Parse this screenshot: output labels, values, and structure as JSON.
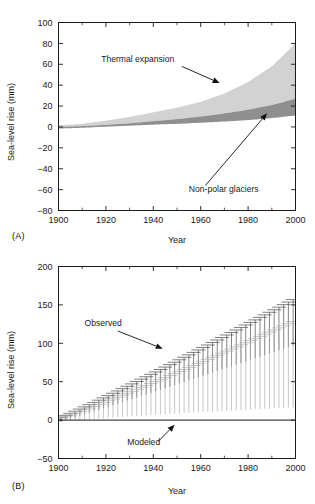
{
  "figure": {
    "panels": [
      {
        "id": "A",
        "label": "(A)",
        "xlabel": "Year",
        "ylabel": "Sea-level rise (mm)"
      },
      {
        "id": "B",
        "label": "(B)",
        "xlabel": "Year",
        "ylabel": "Sea-level rise (mm)"
      }
    ]
  },
  "chart_data": [
    {
      "type": "area",
      "id": "panel-a",
      "title": "",
      "xlabel": "Year",
      "ylabel": "Sea-level rise (mm)",
      "xlim": [
        1900,
        2000
      ],
      "ylim": [
        -80,
        100
      ],
      "xticks": [
        1900,
        1920,
        1940,
        1960,
        1980,
        2000
      ],
      "xtick_labels": [
        "1900",
        "1920",
        "1940",
        "1960",
        "1980",
        "2000"
      ],
      "xticks_minor": [
        1910,
        1930,
        1950,
        1970,
        1990
      ],
      "yticks": [
        -80,
        -60,
        -40,
        -20,
        0,
        20,
        40,
        60,
        80,
        100
      ],
      "ytick_labels": [
        "−80",
        "−60",
        "−40",
        "−20",
        "0",
        "20",
        "40",
        "60",
        "80",
        "100"
      ],
      "grid": false,
      "legend": "none",
      "annotations": [
        {
          "text": "Thermal expansion",
          "text_x": 1918,
          "text_y": 62,
          "arrow_from_x": 1952,
          "arrow_from_y": 58,
          "arrow_to_x": 1968,
          "arrow_to_y": 42
        },
        {
          "text": "Non-polar glaciers",
          "text_x": 1955,
          "text_y": -62,
          "arrow_from_x": 1962,
          "arrow_from_y": -56,
          "arrow_to_x": 1988,
          "arrow_to_y": 13
        }
      ],
      "series": [
        {
          "name": "Thermal expansion",
          "kind": "band",
          "color": "#d2d2d2",
          "x": [
            1900,
            1910,
            1920,
            1930,
            1940,
            1950,
            1960,
            1970,
            1980,
            1990,
            2000
          ],
          "upper": [
            1.5,
            3.0,
            6.0,
            9.5,
            14.0,
            18.5,
            24.0,
            32.0,
            43.0,
            58.0,
            80.0
          ],
          "lower": [
            0.0,
            0.8,
            2.0,
            3.5,
            5.5,
            7.5,
            10.0,
            13.0,
            16.5,
            21.0,
            27.0
          ]
        },
        {
          "name": "Non-polar glaciers",
          "kind": "band",
          "color": "#8f8f8f",
          "x": [
            1900,
            1910,
            1920,
            1930,
            1940,
            1950,
            1960,
            1970,
            1980,
            1990,
            2000
          ],
          "upper": [
            0.0,
            0.8,
            2.0,
            3.5,
            5.5,
            7.5,
            10.0,
            13.0,
            16.5,
            21.0,
            27.0
          ],
          "lower": [
            -1.5,
            -0.8,
            0.3,
            1.2,
            2.2,
            3.0,
            4.0,
            5.2,
            6.6,
            8.5,
            11.0
          ]
        }
      ]
    },
    {
      "type": "line",
      "id": "panel-b",
      "title": "",
      "xlabel": "Year",
      "ylabel": "Sea-level rise (mm)",
      "xlim": [
        1900,
        2000
      ],
      "ylim": [
        -50,
        200
      ],
      "xticks": [
        1900,
        1920,
        1940,
        1960,
        1980,
        2000
      ],
      "xtick_labels": [
        "1900",
        "1920",
        "1940",
        "1960",
        "1980",
        "2000"
      ],
      "xticks_minor": [
        1910,
        1930,
        1950,
        1970,
        1990
      ],
      "yticks": [
        -50,
        0,
        50,
        100,
        150,
        200
      ],
      "ytick_labels": [
        "−50",
        "0",
        "50",
        "100",
        "150",
        "200"
      ],
      "grid": false,
      "legend": "none",
      "annotations": [
        {
          "text": "Observed",
          "text_x": 1911,
          "text_y": 122,
          "arrow_from_x": 1925,
          "arrow_from_y": 116,
          "arrow_to_x": 1944,
          "arrow_to_y": 93
        },
        {
          "text": "Modeled",
          "text_x": 1929,
          "text_y": -33,
          "arrow_from_x": 1942,
          "arrow_from_y": -28,
          "arrow_to_x": 1949,
          "arrow_to_y": -6
        }
      ],
      "series": [
        {
          "name": "Observed",
          "kind": "errorbar",
          "color": "#404040",
          "start_year": 1901,
          "end_year": 1999,
          "step": 2,
          "center_at_start": 1.0,
          "center_at_end": 130.0,
          "half_at_start": 6.0,
          "half_at_end": 60.0
        },
        {
          "name": "Modeled",
          "kind": "errorbar",
          "color": "#a8a8a8",
          "start_year": 1901,
          "end_year": 1999,
          "step": 2,
          "center_at_start": 0.5,
          "center_at_end": 78.0,
          "half_at_start": 5.0,
          "half_at_end": 112.0
        }
      ]
    }
  ]
}
